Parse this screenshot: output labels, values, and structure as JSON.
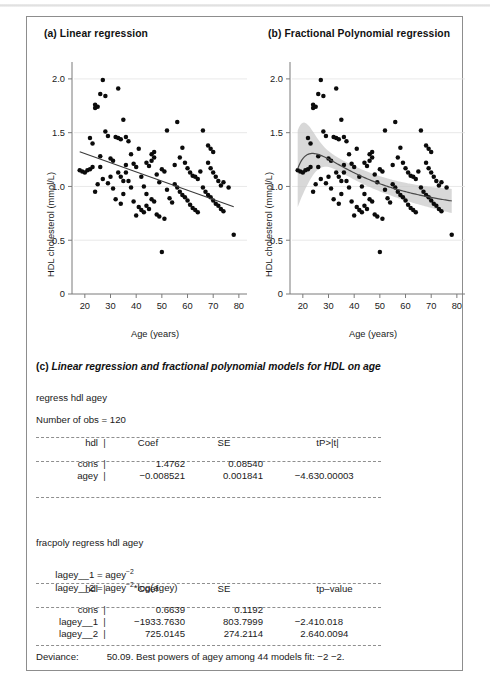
{
  "figure": {
    "panel_a_title": "(a) Linear regression",
    "panel_b_title": "(b) Fractional Polynomial regression",
    "caption_c_mark": "(c)",
    "caption_c_text": "Linear regression and fractional polynomial models for HDL on age"
  },
  "stata": {
    "command_1": "regress hdl agey",
    "nobs_line": "Number of obs = 120",
    "command_2": "fracpoly regress hdl agey",
    "formula_1_lhs": "lagey__1 = agey",
    "formula_1_sup": "−2",
    "formula_2_lhs": "lagey__2 = agey",
    "formula_2_sup": "−2",
    "formula_2_rhs": "*log(agey)",
    "deviance_label": "Deviance:",
    "deviance_value": "50.09. Best powers of agey among 44 models fit: −2 −2."
  },
  "table_linear": {
    "headers": [
      "hdl",
      "|",
      "Coef",
      "SE",
      "t",
      "P>|t|"
    ],
    "rows": [
      {
        "name": "cons",
        "bar": "|",
        "coef": "1.4762",
        "se": "0.08540",
        "t": "",
        "p": ""
      },
      {
        "name": "agey",
        "bar": "|",
        "coef": "−0.008521",
        "se": "0.001841",
        "t": "−4.63",
        "p": "0.00003"
      }
    ]
  },
  "table_fracpoly": {
    "headers": [
      "hdl",
      "|",
      "Coef",
      "SE",
      "t",
      "p–value"
    ],
    "rows": [
      {
        "name": "cons",
        "bar": "|",
        "coef": "0.6639",
        "se": "0.1192",
        "t": "",
        "p": ""
      },
      {
        "name": "lagey__1",
        "bar": "|",
        "coef": "−1933.7630",
        "se": "803.7999",
        "t": "−2.41",
        "p": "0.018"
      },
      {
        "name": "lagey__2",
        "bar": "|",
        "coef": "725.0145",
        "se": "274.2114",
        "t": "2.64",
        "p": "0.0094"
      }
    ]
  },
  "chart_data": [
    {
      "id": "panel-a",
      "type": "scatter",
      "title": "(a) Linear regression",
      "xlabel": "Age (years)",
      "ylabel": "HDL cholesterol (mmol/L)",
      "xlim": [
        15,
        82
      ],
      "ylim": [
        0,
        2.12
      ],
      "xticks": [
        20,
        30,
        40,
        50,
        60,
        70,
        80
      ],
      "yticks": [
        0,
        0.5,
        1.0,
        1.5,
        2.0
      ],
      "ytick_labels": [
        "0",
        "0.5",
        "1.0",
        "1.5",
        "2.0"
      ],
      "grid": "horizontal-faint",
      "legend": "none",
      "fit": {
        "kind": "linear",
        "equation": "hdl = 1.4762 − 0.008521 * agey",
        "intercept": 1.4762,
        "slope": -0.008521,
        "x_start": 18,
        "x_end": 78,
        "y_start": 1.323,
        "y_end": 1.212
      },
      "points": [
        [
          21,
          1.15
        ],
        [
          22,
          1.16
        ],
        [
          23,
          1.18
        ],
        [
          24,
          0.95
        ],
        [
          25,
          1.02
        ],
        [
          22,
          1.45
        ],
        [
          23,
          1.4
        ],
        [
          24,
          1.73
        ],
        [
          25,
          1.74
        ],
        [
          24,
          1.76
        ],
        [
          27,
          1.99
        ],
        [
          26,
          1.86
        ],
        [
          28,
          1.84
        ],
        [
          33,
          1.91
        ],
        [
          29,
          1.47
        ],
        [
          30,
          1.26
        ],
        [
          31,
          1.24
        ],
        [
          32,
          1.46
        ],
        [
          33,
          1.45
        ],
        [
          34,
          1.44
        ],
        [
          28,
          1.51
        ],
        [
          26,
          1.28
        ],
        [
          27,
          1.07
        ],
        [
          29,
          1.03
        ],
        [
          30,
          1.09
        ],
        [
          31,
          0.98
        ],
        [
          32,
          0.88
        ],
        [
          34,
          0.84
        ],
        [
          35,
          1.62
        ],
        [
          36,
          1.46
        ],
        [
          37,
          1.42
        ],
        [
          38,
          1.3
        ],
        [
          39,
          1.21
        ],
        [
          36,
          1.13
        ],
        [
          37,
          1.05
        ],
        [
          38,
          0.99
        ],
        [
          40,
          1.18
        ],
        [
          41,
          1.35
        ],
        [
          42,
          1.09
        ],
        [
          43,
          1.0
        ],
        [
          44,
          0.93
        ],
        [
          45,
          1.19
        ],
        [
          46,
          1.24
        ],
        [
          47,
          1.27
        ],
        [
          46,
          1.3
        ],
        [
          47,
          1.32
        ],
        [
          48,
          1.11
        ],
        [
          49,
          1.04
        ],
        [
          50,
          1.16
        ],
        [
          51,
          1.14
        ],
        [
          52,
          0.97
        ],
        [
          53,
          0.89
        ],
        [
          54,
          0.85
        ],
        [
          41,
          0.81
        ],
        [
          42,
          0.78
        ],
        [
          43,
          0.76
        ],
        [
          44,
          0.82
        ],
        [
          45,
          0.79
        ],
        [
          46,
          0.88
        ],
        [
          47,
          0.86
        ],
        [
          52,
          1.52
        ],
        [
          56,
          1.6
        ],
        [
          58,
          1.36
        ],
        [
          57,
          1.27
        ],
        [
          59,
          1.22
        ],
        [
          60,
          1.17
        ],
        [
          61,
          1.13
        ],
        [
          62,
          1.1
        ],
        [
          63,
          1.09
        ],
        [
          64,
          1.07
        ],
        [
          55,
          1.02
        ],
        [
          56,
          0.99
        ],
        [
          57,
          0.95
        ],
        [
          58,
          0.92
        ],
        [
          59,
          0.9
        ],
        [
          60,
          0.87
        ],
        [
          61,
          0.83
        ],
        [
          62,
          0.8
        ],
        [
          63,
          0.78
        ],
        [
          64,
          0.76
        ],
        [
          66,
          1.52
        ],
        [
          68,
          1.38
        ],
        [
          69,
          1.35
        ],
        [
          70,
          1.32
        ],
        [
          68,
          1.22
        ],
        [
          69,
          1.17
        ],
        [
          70,
          1.13
        ],
        [
          71,
          1.09
        ],
        [
          72,
          1.05
        ],
        [
          73,
          1.01
        ],
        [
          66,
          0.99
        ],
        [
          67,
          0.95
        ],
        [
          68,
          0.92
        ],
        [
          69,
          0.9
        ],
        [
          70,
          0.87
        ],
        [
          71,
          0.84
        ],
        [
          72,
          0.82
        ],
        [
          73,
          0.79
        ],
        [
          74,
          0.77
        ],
        [
          78,
          0.55
        ],
        [
          50,
          0.39
        ],
        [
          35,
          0.93
        ],
        [
          39,
          0.86
        ],
        [
          40,
          0.73
        ],
        [
          48,
          0.74
        ],
        [
          49,
          0.72
        ],
        [
          51,
          0.7
        ],
        [
          33,
          1.13
        ],
        [
          34,
          1.09
        ],
        [
          35,
          1.05
        ],
        [
          19,
          1.14
        ],
        [
          20,
          1.13
        ],
        [
          18,
          1.15
        ],
        [
          26,
          1.18
        ],
        [
          36,
          1.2
        ],
        [
          44,
          1.22
        ],
        [
          55,
          1.2
        ],
        [
          65,
          1.14
        ],
        [
          74,
          1.04
        ],
        [
          76,
          0.99
        ]
      ]
    },
    {
      "id": "panel-b",
      "type": "scatter",
      "title": "(b) Fractional Polynomial regression",
      "xlabel": "Age (years)",
      "ylabel": "HDL cholesterol (mmol/L)",
      "xlim": [
        15,
        82
      ],
      "ylim": [
        0,
        2.12
      ],
      "xticks": [
        20,
        30,
        40,
        50,
        60,
        70,
        80
      ],
      "yticks": [
        0,
        0.5,
        1.0,
        1.5,
        2.0
      ],
      "ytick_labels": [
        "0",
        "0.5",
        "1.0",
        "1.5",
        "2.0"
      ],
      "grid": "horizontal-faint",
      "legend": "none",
      "fit": {
        "kind": "fractional-polynomial",
        "equation": "hdl = 0.6639 − 1933.7630*agey^-2 + 725.0145*agey^-2*log(agey)",
        "b0": 0.6639,
        "b1": -1933.763,
        "b2": 725.0145,
        "powers": [
          -2,
          -2
        ],
        "band": "95% confidence interval, grey shaded"
      }
    }
  ]
}
